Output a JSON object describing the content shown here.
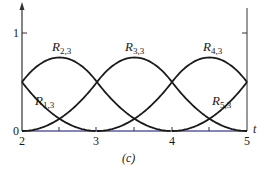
{
  "chart_data": {
    "type": "line",
    "title": "",
    "caption": "(c)",
    "xlabel": "t",
    "ylabel": "",
    "xlim": [
      2,
      5
    ],
    "ylim": [
      0,
      1
    ],
    "x_ticks": [
      "2",
      "3",
      "4",
      "5"
    ],
    "y_ticks": [
      "0",
      "1"
    ],
    "minor_x_ticks": [
      2.5,
      3.5,
      4.5
    ],
    "grid": false,
    "legend": "none (curves labeled inline)",
    "x": [
      2,
      2.25,
      2.5,
      2.75,
      3,
      3.25,
      3.5,
      3.75,
      4,
      4.25,
      4.5,
      4.75,
      5
    ],
    "series": [
      {
        "name": "R1,3",
        "values": [
          0.5,
          0.28125,
          0.125,
          0.03125,
          0,
          0,
          0,
          0,
          0,
          0,
          0,
          0,
          0
        ]
      },
      {
        "name": "R2,3",
        "values": [
          0.5,
          0.6875,
          0.75,
          0.6875,
          0.5,
          0.28125,
          0.125,
          0.03125,
          0,
          0,
          0,
          0,
          0
        ]
      },
      {
        "name": "R3,3",
        "values": [
          0,
          0.03125,
          0.125,
          0.28125,
          0.5,
          0.6875,
          0.75,
          0.6875,
          0.5,
          0.28125,
          0.125,
          0.03125,
          0
        ]
      },
      {
        "name": "R4,3",
        "values": [
          0,
          0,
          0,
          0,
          0,
          0.03125,
          0.125,
          0.28125,
          0.5,
          0.6875,
          0.75,
          0.6875,
          0.5
        ]
      },
      {
        "name": "R5,3",
        "values": [
          0,
          0,
          0,
          0,
          0,
          0,
          0,
          0,
          0,
          0.03125,
          0.125,
          0.28125,
          0.5
        ]
      }
    ]
  },
  "labels": {
    "r13": {
      "base": "R",
      "sub": "1,3"
    },
    "r23": {
      "base": "R",
      "sub": "2,3"
    },
    "r33": {
      "base": "R",
      "sub": "3,3"
    },
    "r43": {
      "base": "R",
      "sub": "4,3"
    },
    "r53": {
      "base": "R",
      "sub": "5,3"
    }
  },
  "axis": {
    "y_one": "1",
    "y_zero": "0",
    "x_2": "2",
    "x_3": "3",
    "x_4": "4",
    "x_5": "5",
    "t": "t"
  },
  "caption": "(c)",
  "colors": {
    "curve": "#1a1a1a",
    "axis": "#333333",
    "baseline": "#5a5aa8"
  }
}
